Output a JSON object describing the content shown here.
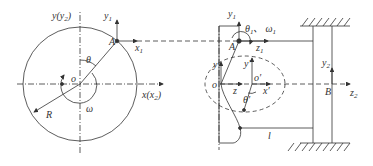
{
  "left_view": {
    "y_axis_label": "y(y",
    "y_axis_sub": "2",
    "y_axis_close": ")",
    "x_axis_label": "x(x",
    "x_axis_sub": "2",
    "x_axis_close": ")",
    "origin_label": "o",
    "point_A_label": "A",
    "y1_label": "y",
    "y1_sub": "1",
    "x1_label": "x",
    "x1_sub": "1",
    "theta_label": "θ",
    "omega_label": "ω",
    "radius_label": "R"
  },
  "right_view": {
    "y1_label": "y",
    "y1_sub": "1",
    "theta1_label": "θ",
    "theta1_sub": "1",
    "separator": "、",
    "omega1_label": "ω",
    "omega1_sub": "1",
    "point_A_label": "A",
    "z1_label": "z",
    "z1_sub": "1",
    "y_label": "y",
    "y_prime_label": "y′",
    "origin_label": "o",
    "o_prime_label": "o′",
    "z_label": "z",
    "x_prime_label": "x′",
    "theta_prime_label": "θ′",
    "length_label": "l",
    "y2_label": "y",
    "y2_sub": "2",
    "point_B_label": "B",
    "z2_label": "z",
    "z2_sub": "2"
  },
  "colors": {
    "line": "#333333",
    "background": "#ffffff"
  }
}
